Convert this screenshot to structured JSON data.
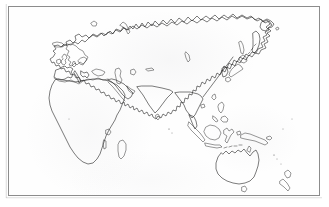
{
  "figure": {
    "kind": "outline-map",
    "projection": "equirectangular, Asia-centred",
    "background_color": "#fefefe",
    "coastline_color": "#2a2a2a",
    "frame_color": "#8c8c8c",
    "paper_color": "#ffffff",
    "has_labels": false,
    "has_graticule": false,
    "has_legend": false,
    "has_scale_bar": false,
    "visible_text": ""
  },
  "frame": {
    "left": 8,
    "top": 6,
    "width": 312,
    "height": 190,
    "border_width": 1
  },
  "regions": [
    {
      "name": "europe",
      "label": ""
    },
    {
      "name": "africa",
      "label": ""
    },
    {
      "name": "asia",
      "label": ""
    },
    {
      "name": "siberia",
      "label": ""
    },
    {
      "name": "arabian-peninsula",
      "label": ""
    },
    {
      "name": "indian-subcontinent",
      "label": ""
    },
    {
      "name": "southeast-asia",
      "label": ""
    },
    {
      "name": "australia",
      "label": ""
    },
    {
      "name": "new-zealand",
      "label": ""
    },
    {
      "name": "japan",
      "label": ""
    },
    {
      "name": "korean-peninsula",
      "label": ""
    },
    {
      "name": "kamchatka",
      "label": ""
    },
    {
      "name": "chukotka",
      "label": ""
    },
    {
      "name": "iceland",
      "label": ""
    },
    {
      "name": "british-isles",
      "label": ""
    },
    {
      "name": "scandinavia",
      "label": ""
    },
    {
      "name": "madagascar",
      "label": ""
    },
    {
      "name": "sri-lanka",
      "label": ""
    },
    {
      "name": "new-guinea",
      "label": ""
    },
    {
      "name": "philippines",
      "label": ""
    },
    {
      "name": "borneo",
      "label": ""
    },
    {
      "name": "sumatra",
      "label": ""
    },
    {
      "name": "java",
      "label": ""
    },
    {
      "name": "sulawesi",
      "label": ""
    },
    {
      "name": "tasmania",
      "label": ""
    },
    {
      "name": "novaya-zemlya",
      "label": ""
    },
    {
      "name": "sakhalin",
      "label": ""
    },
    {
      "name": "taiwan",
      "label": ""
    },
    {
      "name": "hainan",
      "label": ""
    }
  ],
  "water_bodies": [
    {
      "name": "mediterranean-sea",
      "label": ""
    },
    {
      "name": "black-sea",
      "label": ""
    },
    {
      "name": "caspian-sea",
      "label": ""
    },
    {
      "name": "aral-sea",
      "label": ""
    },
    {
      "name": "red-sea",
      "label": ""
    },
    {
      "name": "persian-gulf",
      "label": ""
    },
    {
      "name": "lake-baikal",
      "label": ""
    },
    {
      "name": "lake-victoria",
      "label": ""
    },
    {
      "name": "lake-tanganyika",
      "label": ""
    },
    {
      "name": "lake-balkhash",
      "label": ""
    }
  ]
}
